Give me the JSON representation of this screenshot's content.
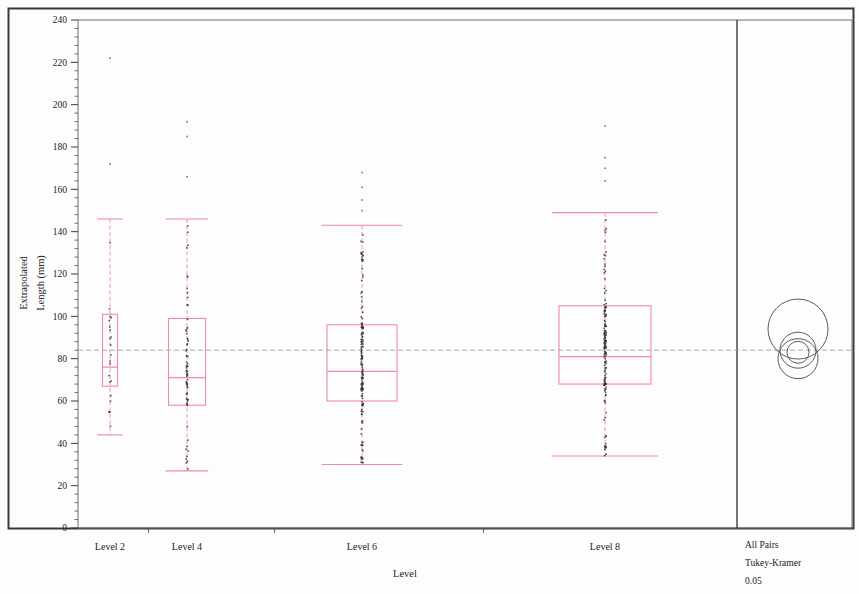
{
  "figure": {
    "kind": "oneway-analysis-boxplot",
    "outer_border_color": "#3a3a3a",
    "frame_color": "#6e6e6e",
    "box_color": "#ef8aa8",
    "point_color": "#2b2b2b",
    "grand_mean_color": "#9aa0a8",
    "circle_color": "#5a5a66"
  },
  "axes": {
    "y_title_line1": "Extrapolated",
    "y_title_line2": "Length (mm)",
    "x_title": "Level",
    "y_ticks": [
      0,
      20,
      40,
      60,
      80,
      100,
      120,
      140,
      160,
      180,
      200,
      220,
      240
    ],
    "y_min": 0,
    "y_max": 240,
    "minor_ticks_per_major": 4
  },
  "legend": {
    "line1": "All Pairs",
    "line2": "Tukey-Kramer",
    "line3": "0.05"
  },
  "chart_data": {
    "type": "box",
    "title": "",
    "xlabel": "Level",
    "ylabel": "Extrapolated Length (mm)",
    "ylim": [
      0,
      240
    ],
    "grid": false,
    "legend_position": "right-panel",
    "grand_mean": 84,
    "categories": [
      "Level 2",
      "Level 4",
      "Level 6",
      "Level 8"
    ],
    "boxes": [
      {
        "name": "Level 2",
        "x_center": 110,
        "box_width": 15,
        "whisker_low": 44,
        "q1": 67,
        "median": 76,
        "q3": 101,
        "whisker_high": 146,
        "outliers": [
          222,
          172
        ],
        "n_points": 22
      },
      {
        "name": "Level 4",
        "x_center": 187,
        "box_width": 37,
        "whisker_low": 27,
        "q1": 58,
        "median": 71,
        "q3": 99,
        "whisker_high": 146,
        "outliers": [
          192,
          185,
          166
        ],
        "n_points": 70
      },
      {
        "name": "Level 6",
        "x_center": 362,
        "box_width": 70,
        "whisker_low": 30,
        "q1": 60,
        "median": 74,
        "q3": 96,
        "whisker_high": 143,
        "outliers": [
          168,
          161,
          155,
          150
        ],
        "n_points": 150
      },
      {
        "name": "Level 8",
        "x_center": 605,
        "box_width": 92,
        "whisker_low": 34,
        "q1": 68,
        "median": 81,
        "q3": 105,
        "whisker_high": 149,
        "outliers": [
          190,
          175,
          170,
          164
        ],
        "n_points": 150
      }
    ],
    "comparison_circles": [
      {
        "label": "Level 2",
        "cy": 94,
        "r_px": 30
      },
      {
        "label": "Level 4",
        "cy": 84,
        "r_px": 18
      },
      {
        "label": "Level 6",
        "cy": 83,
        "r_px": 11
      },
      {
        "label": "Level 8",
        "cy": 80,
        "r_px": 20
      }
    ]
  }
}
